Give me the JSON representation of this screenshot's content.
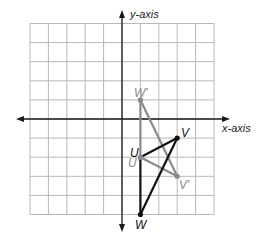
{
  "axes": {
    "x_label": "x-axis",
    "y_label": "y-axis",
    "range": {
      "xmin": -5,
      "xmax": 5,
      "ymin": -5,
      "ymax": 5
    }
  },
  "grid": {
    "origin_px": [
      122,
      119
    ],
    "cell_px": [
      18.4,
      19.1
    ],
    "color": "#b8b8b8"
  },
  "original_triangle": {
    "color": "#111111",
    "points": [
      {
        "label": "U",
        "x": 1,
        "y": -2
      },
      {
        "label": "V",
        "x": 3,
        "y": -1
      },
      {
        "label": "W",
        "x": 1,
        "y": -5
      }
    ]
  },
  "image_triangle": {
    "color": "#8a8a8a",
    "points": [
      {
        "label": "U'",
        "x": 1,
        "y": -2
      },
      {
        "label": "V'",
        "x": 3,
        "y": -3
      },
      {
        "label": "W'",
        "x": 1,
        "y": 1
      }
    ]
  }
}
